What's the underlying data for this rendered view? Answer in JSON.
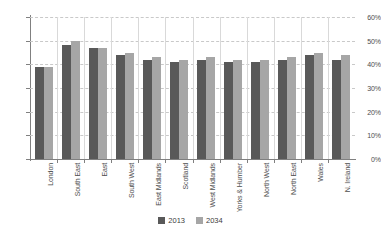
{
  "chart_data": {
    "type": "bar",
    "title": "",
    "xlabel": "",
    "ylabel": "",
    "ylim": [
      0,
      60
    ],
    "ytick_labels": [
      "0%",
      "10%",
      "20%",
      "30%",
      "40%",
      "50%",
      "60%"
    ],
    "ytick_values": [
      0,
      10,
      20,
      30,
      40,
      50,
      60
    ],
    "grid": true,
    "legend_position": "bottom-center",
    "categories": [
      "London",
      "South East",
      "East",
      "South West",
      "East Midlands",
      "Scotland",
      "West Midlands",
      "Yorks & Humber",
      "North West",
      "North East",
      "Wales",
      "N. Ireland"
    ],
    "series": [
      {
        "name": "2013",
        "color": "#595959",
        "values": [
          39,
          48,
          47,
          44,
          42,
          41,
          42,
          41,
          41,
          42,
          44,
          42
        ]
      },
      {
        "name": "2034",
        "color": "#a6a6a6",
        "values": [
          39,
          50,
          47,
          45,
          43,
          42,
          43,
          42,
          42,
          43,
          45,
          44
        ]
      }
    ]
  },
  "colors": {
    "series_2013": "#595959",
    "series_2034": "#a6a6a6",
    "axis": "#808080",
    "gridline": "#c9c9c9",
    "separator": "#d9d9d9",
    "text": "#4d4d4d",
    "background": "#ffffff"
  }
}
